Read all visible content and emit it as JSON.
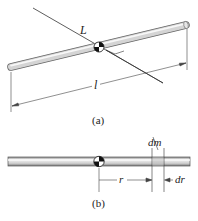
{
  "figure": {
    "panel_a": {
      "caption": "(a)",
      "axis_label": "L",
      "length_label": "l",
      "elements": [
        "rod",
        "center-of-mass-symbol",
        "rotation-axis-line",
        "right-angle-mark",
        "length-dimension-arrow"
      ]
    },
    "panel_b": {
      "caption": "(b)",
      "mass_element_label": "dm",
      "distance_label": "r",
      "width_label": "dr",
      "elements": [
        "rod",
        "center-of-mass-symbol",
        "distance-arrow",
        "mass-element-lines"
      ]
    },
    "colors": {
      "rod_fill": "#d8d8d8",
      "rod_highlight": "#f4f4f4",
      "rod_edge": "#555555",
      "line": "#333333",
      "text": "#222222"
    }
  }
}
